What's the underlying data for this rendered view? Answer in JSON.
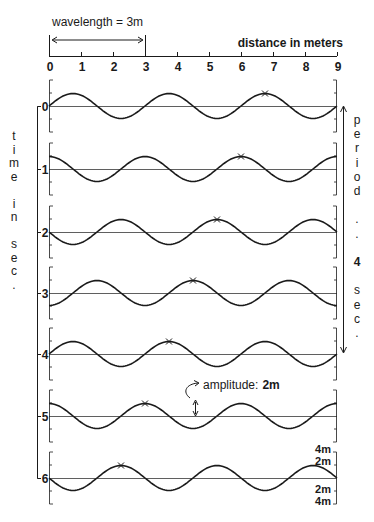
{
  "wavelength_label": "wavelength = 3m",
  "axis_title": "distance in meters",
  "x_ticks": [
    "0",
    "1",
    "2",
    "3",
    "4",
    "5",
    "6",
    "7",
    "8",
    "9"
  ],
  "time_label_letters": [
    "t",
    "i",
    "m",
    "e",
    "",
    "i",
    "n",
    "",
    "s",
    "e",
    "c",
    "."
  ],
  "period_label_letters": [
    "p",
    "e",
    "r",
    "i",
    "o",
    "d",
    "",
    ".",
    " .",
    "",
    "4",
    "",
    "s",
    "e",
    "c",
    "."
  ],
  "amplitude_label": "amplitude:",
  "amplitude_value": "2m",
  "scale_labels": [
    "4m",
    "2m",
    "2m",
    "4m"
  ],
  "rows": [
    {
      "time": "0",
      "marker_x_m": 6.75
    },
    {
      "time": "1",
      "marker_x_m": 6.0
    },
    {
      "time": "2",
      "marker_x_m": 5.25
    },
    {
      "time": "3",
      "marker_x_m": 4.5
    },
    {
      "time": "4",
      "marker_x_m": 3.75
    },
    {
      "time": "5",
      "marker_x_m": 3.0
    },
    {
      "time": "6",
      "marker_x_m": 2.25
    }
  ],
  "wave": {
    "wavelength_m": 3,
    "period_s": 4,
    "amplitude_m": 2,
    "shift_per_sec_m": 0.75
  },
  "colors": {
    "ink": "#1a1a1a",
    "background": "#ffffff"
  }
}
